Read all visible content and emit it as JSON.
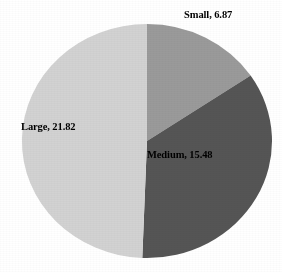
{
  "chart_data": {
    "type": "pie",
    "title": "",
    "subtitle": "",
    "xlabel": "",
    "ylabel": "",
    "grid": false,
    "legend_position": "none",
    "label_format": "name, value",
    "start_angle_deg": 0,
    "direction": "clockwise",
    "total": 44.17,
    "categories": [
      "Small",
      "Medium",
      "Large"
    ],
    "values": [
      6.87,
      15.48,
      21.82
    ],
    "slice_angles_deg": [
      55.99,
      126.17,
      177.84
    ],
    "colors": [
      "#9a9a9a",
      "#555555",
      "#d2d2d2"
    ],
    "slices": [
      {
        "name": "Small",
        "value": 6.87,
        "label": "Small, 6.87",
        "color": "#9a9a9a",
        "percent": 15.6,
        "start_angle_deg": 0,
        "end_angle_deg": 55.99,
        "label_placement": "outside-top-right"
      },
      {
        "name": "Medium",
        "value": 15.48,
        "label": "Medium, 15.48",
        "color": "#555555",
        "percent": 35.0,
        "start_angle_deg": 55.99,
        "end_angle_deg": 182.16,
        "label_placement": "inside"
      },
      {
        "name": "Large",
        "value": 21.82,
        "label": "Large, 21.82",
        "color": "#d2d2d2",
        "percent": 49.4,
        "start_angle_deg": 182.16,
        "end_angle_deg": 360,
        "label_placement": "inside-left"
      }
    ]
  },
  "geometry": {
    "center_x": 147,
    "center_y": 141,
    "radius_x": 125,
    "radius_y": 117
  },
  "style": {
    "background": "#ffffff",
    "label_color": "#000000"
  }
}
